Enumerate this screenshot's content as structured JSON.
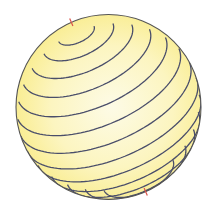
{
  "diagram": {
    "title": "",
    "sphere": {
      "cx": 108.5,
      "cy": 107,
      "r": 92.5
    },
    "axis": {
      "tilt_deg": 23.7,
      "view_elevation_deg": 28
    },
    "latitudes_deg": [
      78,
      66,
      54,
      42,
      30,
      18,
      6,
      -6,
      -18,
      -30,
      -42,
      -54,
      -66
    ],
    "colors": {
      "fill_edge": "#f9ec8c",
      "fill_center": "#fdfbe6",
      "line": "#4a4e6a",
      "outline": "#555555",
      "pole_tick": "#d9534a"
    }
  }
}
